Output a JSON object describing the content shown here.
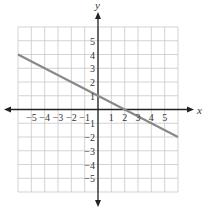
{
  "chart_data": {
    "type": "line",
    "title": "",
    "xlabel": "x",
    "ylabel": "y",
    "xlim": [
      -6,
      6
    ],
    "ylim": [
      -6,
      6
    ],
    "grid": true,
    "x_ticks": [
      -5,
      -4,
      -3,
      -2,
      -1,
      1,
      2,
      3,
      4,
      5
    ],
    "y_ticks": [
      5,
      4,
      3,
      2,
      1,
      -1,
      -2,
      -3,
      -4,
      -5
    ],
    "x_tick_labels": [
      "−5",
      "−4",
      "−3",
      "−2",
      "−1",
      "1",
      "2",
      "3",
      "4",
      "5"
    ],
    "y_tick_labels": [
      "5",
      "4",
      "3",
      "2",
      "1",
      "−1",
      "−2",
      "−3",
      "−4",
      "−5"
    ],
    "series": [
      {
        "name": "y = -x/2 + 1",
        "x": [
          -6,
          6
        ],
        "y": [
          4,
          -2
        ],
        "color": "#888888"
      }
    ]
  }
}
